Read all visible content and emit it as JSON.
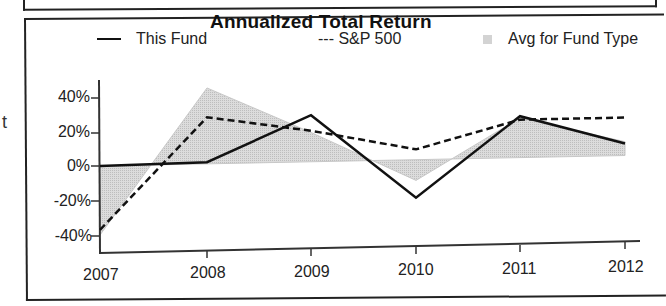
{
  "chart_data": {
    "type": "line",
    "title": "Annualized Total Return",
    "xlabel": "",
    "ylabel": "",
    "categories": [
      "2007",
      "2008",
      "2009",
      "2010",
      "2011",
      "2012"
    ],
    "series": [
      {
        "name": "This Fund",
        "style": "solid",
        "color": "#111111",
        "values": [
          0,
          1,
          27,
          -22,
          24,
          7
        ]
      },
      {
        "name": "S&P 500",
        "style": "dashed",
        "color": "#111111",
        "values": [
          -37,
          27,
          18,
          6,
          22,
          22
        ]
      },
      {
        "name": "Avg for Fund Type",
        "style": "area",
        "color": "#d3d3d3",
        "values": [
          -40,
          44,
          17,
          -12,
          23,
          8
        ]
      }
    ],
    "yticks": [
      "40%",
      "20%",
      "0%",
      "-20%",
      "-40%"
    ],
    "ylim": [
      -45,
      45
    ],
    "grid": false,
    "legend_position": "top"
  },
  "legend": {
    "this_fund": "This Fund",
    "sp500": "--- S&P 500",
    "avg": "Avg for Fund Type"
  },
  "margin_text": "t"
}
